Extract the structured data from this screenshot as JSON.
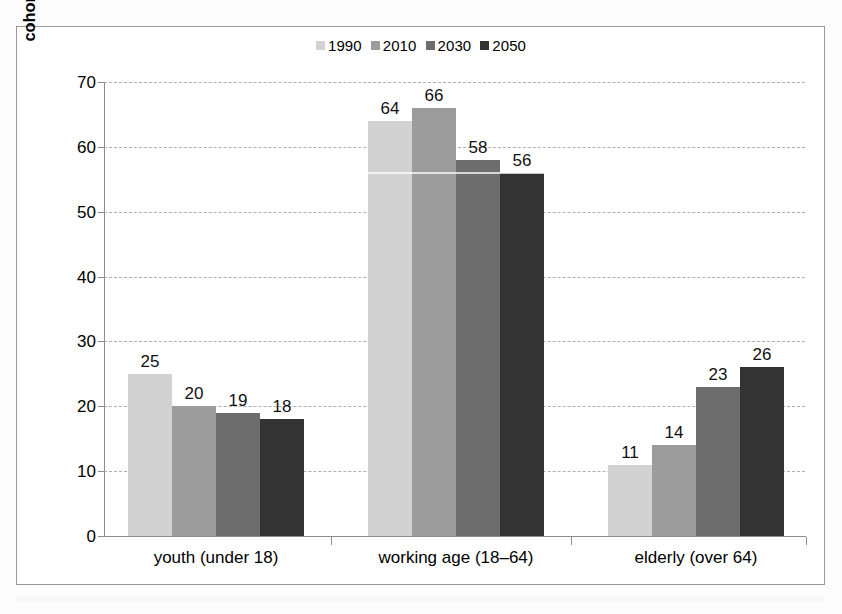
{
  "chart_data": {
    "type": "bar",
    "title": "",
    "xlabel": "",
    "ylabel": "cohort share of population (per cent)",
    "ylim": [
      0,
      70
    ],
    "ytick_step": 10,
    "yticks": [
      70,
      60,
      50,
      40,
      30,
      20,
      10,
      0
    ],
    "grid": true,
    "legend_position": "top-center",
    "categories": [
      "youth (under 18)",
      "working age (18–64)",
      "elderly (over 64)"
    ],
    "series": [
      {
        "name": "1990",
        "color": "#d2d2d2",
        "values": [
          25,
          64,
          11
        ]
      },
      {
        "name": "2010",
        "color": "#9c9c9c",
        "values": [
          20,
          66,
          14
        ]
      },
      {
        "name": "2030",
        "color": "#6d6d6d",
        "values": [
          19,
          58,
          23
        ]
      },
      {
        "name": "2050",
        "color": "#333333",
        "values": [
          18,
          56,
          26
        ]
      }
    ],
    "data_labels": [
      [
        "25",
        "20",
        "19",
        "18"
      ],
      [
        "64",
        "66",
        "58",
        "56"
      ],
      [
        "11",
        "14",
        "23",
        "26"
      ]
    ]
  },
  "colors": {
    "axis": "#8d8d8d",
    "grid": "#b0b0b0",
    "frame": "#9a9a9a",
    "text": "#000000",
    "background": "#ffffff"
  }
}
